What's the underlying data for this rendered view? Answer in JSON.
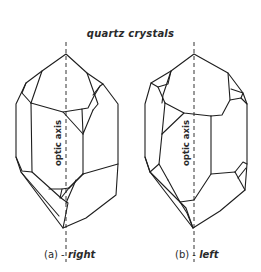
{
  "title": "quartz crystals",
  "crystals": [
    {
      "id": "a",
      "axis_label": "optic axis",
      "caption_prefix": "(a) - ",
      "caption_word": "right"
    },
    {
      "id": "b",
      "axis_label": "optic axis",
      "caption_prefix": "(b) - ",
      "caption_word": "left"
    }
  ]
}
